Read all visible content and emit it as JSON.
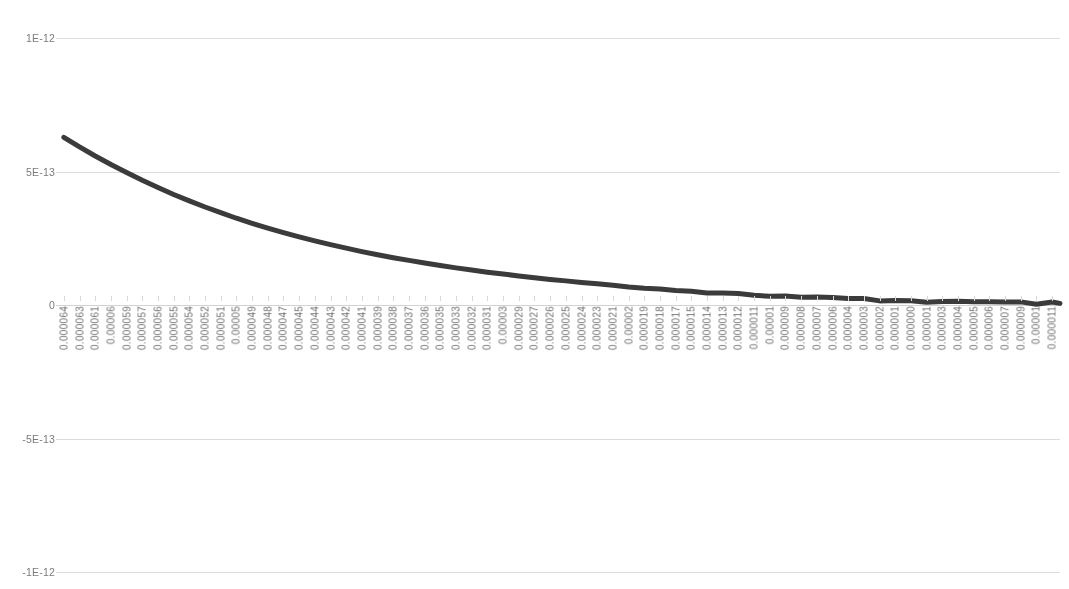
{
  "chart_data": {
    "type": "line",
    "title": "",
    "subtitle": "",
    "xlabel": "",
    "ylabel": "",
    "grid": true,
    "legend": null,
    "legend_position": "none",
    "line_color": "#3b3b3b",
    "line_width_px": 5,
    "ylim": [
      -1e-12,
      1e-12
    ],
    "yticks": [
      1e-12,
      5e-13,
      0,
      -5e-13,
      -1e-12
    ],
    "ytick_labels": [
      "1E-12",
      "5E-13",
      "0",
      "-5E-13",
      "-1E-12"
    ],
    "xtick_labels": [
      "0.000064",
      "0.000063",
      "0.000061",
      "0.00006",
      "0.000059",
      "0.000057",
      "0.000056",
      "0.000055",
      "0.000054",
      "0.000052",
      "0.000051",
      "0.00005",
      "0.000049",
      "0.000048",
      "0.000047",
      "0.000045",
      "0.000044",
      "0.000043",
      "0.000042",
      "0.000041",
      "0.000039",
      "0.000038",
      "0.000037",
      "0.000036",
      "0.000035",
      "0.000033",
      "0.000032",
      "0.000031",
      "0.00003",
      "0.000029",
      "0.000027",
      "0.000026",
      "0.000025",
      "0.000024",
      "0.000023",
      "0.000021",
      "0.00002",
      "0.000019",
      "0.000018",
      "0.000017",
      "0.000015",
      "0.000014",
      "0.000013",
      "0.000012",
      "0.000011",
      "0.00001",
      "0.000009",
      "0.000008",
      "0.000007",
      "0.000006",
      "0.000004",
      "0.000003",
      "0.000002",
      "0.000001",
      "0.000000",
      "0.000001",
      "0.000003",
      "0.000004",
      "0.000005",
      "0.000006",
      "0.000007",
      "0.000009",
      "0.00001",
      "0.000011"
    ],
    "x": [
      0,
      1,
      2,
      3,
      4,
      5,
      6,
      7,
      8,
      9,
      10,
      11,
      12,
      13,
      14,
      15,
      16,
      17,
      18,
      19,
      20,
      21,
      22,
      23,
      24,
      25,
      26,
      27,
      28,
      29,
      30,
      31,
      32,
      33,
      34,
      35,
      36,
      37,
      38,
      39,
      40,
      41,
      42,
      43,
      44,
      45,
      46,
      47,
      48,
      49,
      50,
      51,
      52,
      53,
      54,
      55,
      56,
      57,
      58,
      59,
      60,
      61,
      62,
      63
    ],
    "values": [
      6.28e-13,
      5.92e-13,
      5.58e-13,
      5.26e-13,
      4.96e-13,
      4.67e-13,
      4.4e-13,
      4.14e-13,
      3.9e-13,
      3.67e-13,
      3.46e-13,
      3.25e-13,
      3.06e-13,
      2.88e-13,
      2.71e-13,
      2.55e-13,
      2.4e-13,
      2.26e-13,
      2.13e-13,
      2e-13,
      1.88e-13,
      1.77e-13,
      1.67e-13,
      1.57e-13,
      1.48e-13,
      1.39e-13,
      1.31e-13,
      1.23e-13,
      1.16e-13,
      1.09e-13,
      1.02e-13,
      9.6e-14,
      9e-14,
      8.45e-14,
      7.9e-14,
      7.4e-14,
      6.9e-14,
      6.45e-14,
      6e-14,
      5.6e-14,
      5.2e-14,
      4.8e-14,
      4.45e-14,
      4.1e-14,
      3.8e-14,
      3.5e-14,
      3.2e-14,
      2.95e-14,
      2.7e-14,
      2.45e-14,
      2.25e-14,
      2.05e-14,
      1.85e-14,
      1.7e-14,
      1.5e-14,
      1.4e-14,
      1.25e-14,
      1.15e-14,
      1e-14,
      9e-15,
      8e-15,
      7e-15,
      6.5e-15,
      6e-15
    ],
    "noise_region_note": "slight jitter in the flattened tail near the right half of the series"
  }
}
